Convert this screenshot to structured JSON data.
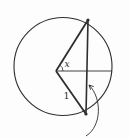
{
  "diagram": {
    "background_color": "#fdfdfd",
    "stroke_color": "#2e2e2e",
    "labels": {
      "angle": "x",
      "side": "1"
    },
    "geometry": {
      "circle": {
        "cx": 63,
        "cy": 66.5,
        "r": 49
      },
      "vertex": {
        "x": 56,
        "y": 71
      },
      "chord_top": {
        "x": 88,
        "y": 20
      },
      "chord_bottom": {
        "x": 86,
        "y": 114
      },
      "horizontal_end": {
        "x": 112,
        "y": 71
      },
      "angle_arc_radius": 7,
      "endpoint_dot_radius": 1.6,
      "angle_label_pos": {
        "x": 64.5,
        "y": 67
      },
      "side_label_pos": {
        "x": 63.5,
        "y": 99
      },
      "arrow": {
        "tail": {
          "x": 86,
          "y": 136
        },
        "c1": {
          "x": 102,
          "y": 126
        },
        "c2": {
          "x": 102,
          "y": 98
        },
        "head": {
          "x": 89,
          "y": 85
        },
        "head_length": 5,
        "head_spread": 0.46
      }
    }
  }
}
